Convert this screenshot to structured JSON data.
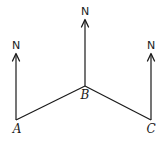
{
  "diagram": {
    "type": "bearing-diagram",
    "points": [
      {
        "id": "A",
        "label": "A",
        "x": 16,
        "y": 120,
        "north_label": "N"
      },
      {
        "id": "B",
        "label": "B",
        "x": 85,
        "y": 86,
        "north_label": "N"
      },
      {
        "id": "C",
        "label": "C",
        "x": 151,
        "y": 120,
        "north_label": "N"
      }
    ],
    "segments": [
      {
        "from": "A",
        "to": "B"
      },
      {
        "from": "B",
        "to": "C"
      }
    ],
    "north_arrows": [
      {
        "point": "A",
        "label": "N",
        "tip_y": 53
      },
      {
        "point": "B",
        "label": "N",
        "tip_y": 19
      },
      {
        "point": "C",
        "label": "N",
        "tip_y": 53
      }
    ],
    "colors": {
      "stroke": "#1a1a1a",
      "background": "#ffffff"
    }
  }
}
